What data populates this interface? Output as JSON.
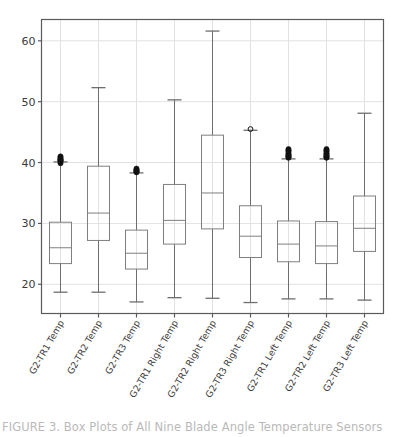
{
  "figure": {
    "background_color": "#ffffff",
    "axes_color": "#5a5a5a",
    "grid_color": "#e2e2e2",
    "box_edge_color": "#7f7f7f",
    "whisker_color": "#6e6e6e",
    "outlier_color": "#111111"
  },
  "caption": {
    "text": "FIGURE 3. Box Plots of All Nine Blade Angle Temperature Sensors"
  },
  "chart_data": {
    "type": "box",
    "title": "",
    "xlabel": "",
    "ylabel": "",
    "ylim": [
      15.2,
      63.5
    ],
    "yticks": [
      20,
      30,
      40,
      50,
      60
    ],
    "ytick_labels": [
      "20",
      "30",
      "40",
      "50",
      "60"
    ],
    "grid": true,
    "grid_axis": "both",
    "legend": "none",
    "categories": [
      "G2-TR1 Temp",
      "G2-TR2 Temp",
      "G2-TR3 Temp",
      "G2-TR1 Right Temp",
      "G2-TR2 Right Temp",
      "G2-TR3 Right Temp",
      "G2-TR1 Left Temp",
      "G2-TR2 Left Temp",
      "G2-TR3 Left Temp"
    ],
    "boxes": [
      {
        "label": "G2-TR1 Temp",
        "whisker_low": 18.7,
        "q1": 23.4,
        "median": 26.0,
        "q3": 30.2,
        "whisker_high": 40.1,
        "outliers": [
          40.2,
          40.4,
          40.6,
          40.8,
          41.0,
          39.9,
          40.3,
          40.5
        ]
      },
      {
        "label": "G2-TR2 Temp",
        "whisker_low": 18.7,
        "q1": 27.2,
        "median": 31.7,
        "q3": 39.4,
        "whisker_high": 52.3,
        "outliers": []
      },
      {
        "label": "G2-TR3 Temp",
        "whisker_low": 17.1,
        "q1": 22.5,
        "median": 25.1,
        "q3": 28.9,
        "whisker_high": 38.3,
        "outliers": [
          38.4,
          38.6,
          38.8,
          39.0,
          38.5,
          38.7
        ]
      },
      {
        "label": "G2-TR1 Right Temp",
        "whisker_low": 17.8,
        "q1": 26.6,
        "median": 30.5,
        "q3": 36.4,
        "whisker_high": 50.3,
        "outliers": []
      },
      {
        "label": "G2-TR2 Right Temp",
        "whisker_low": 17.7,
        "q1": 29.1,
        "median": 35.0,
        "q3": 44.5,
        "whisker_high": 61.6,
        "outliers": []
      },
      {
        "label": "G2-TR3 Right Temp",
        "whisker_low": 17.0,
        "q1": 24.4,
        "median": 27.9,
        "q3": 32.9,
        "whisker_high": 45.3,
        "outliers": [
          45.5
        ]
      },
      {
        "label": "G2-TR1 Left Temp",
        "whisker_low": 17.6,
        "q1": 23.7,
        "median": 26.6,
        "q3": 30.4,
        "whisker_high": 40.6,
        "outliers": [
          40.8,
          41.0,
          41.2,
          41.5,
          41.8,
          42.0,
          42.2,
          40.9,
          41.3
        ]
      },
      {
        "label": "G2-TR2 Left Temp",
        "whisker_low": 17.6,
        "q1": 23.4,
        "median": 26.3,
        "q3": 30.3,
        "whisker_high": 40.6,
        "outliers": [
          40.8,
          41.0,
          41.2,
          41.5,
          41.8,
          42.0,
          42.2,
          40.9,
          41.4
        ]
      },
      {
        "label": "G2-TR3 Left Temp",
        "whisker_low": 17.4,
        "q1": 25.4,
        "median": 29.2,
        "q3": 34.5,
        "whisker_high": 48.1,
        "outliers": []
      }
    ]
  }
}
